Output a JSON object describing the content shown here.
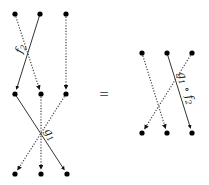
{
  "diagram": {
    "left": {
      "top_label": "f",
      "top_label_sub": "2",
      "bottom_label": "g",
      "bottom_label_sub": "1",
      "nodes": {
        "top": [
          [
            15,
            14
          ],
          [
            40,
            14
          ],
          [
            66,
            14
          ]
        ],
        "middle": [
          [
            15,
            94
          ],
          [
            41,
            94
          ],
          [
            66,
            94
          ]
        ],
        "bottom": [
          [
            15,
            174
          ],
          [
            41,
            174
          ],
          [
            67,
            174
          ]
        ]
      },
      "edges": [
        {
          "from": [
            40,
            14
          ],
          "to": [
            15,
            94
          ],
          "style": "solid"
        },
        {
          "from": [
            15,
            14
          ],
          "to": [
            41,
            94
          ],
          "style": "dotted"
        },
        {
          "from": [
            66,
            14
          ],
          "to": [
            66,
            94
          ],
          "style": "dotted"
        },
        {
          "from": [
            15,
            94
          ],
          "to": [
            67,
            174
          ],
          "style": "solid"
        },
        {
          "from": [
            66,
            94
          ],
          "to": [
            15,
            174
          ],
          "style": "dotted"
        },
        {
          "from": [
            41,
            94
          ],
          "to": [
            41,
            174
          ],
          "style": "dotted"
        }
      ]
    },
    "equals": "=",
    "right": {
      "label": "g",
      "label_sub1": "1",
      "label_op": "∘",
      "label2": "f",
      "label_sub2": "2",
      "nodes": {
        "top": [
          [
            142,
            53
          ],
          [
            167,
            53
          ],
          [
            192,
            53
          ]
        ],
        "bottom": [
          [
            142,
            133
          ],
          [
            167,
            133
          ],
          [
            192,
            133
          ]
        ]
      },
      "edges": [
        {
          "from": [
            167,
            53
          ],
          "to": [
            192,
            133
          ],
          "style": "solid"
        },
        {
          "from": [
            142,
            53
          ],
          "to": [
            167,
            133
          ],
          "style": "dotted"
        },
        {
          "from": [
            192,
            53
          ],
          "to": [
            142,
            133
          ],
          "style": "dotted"
        }
      ]
    }
  }
}
